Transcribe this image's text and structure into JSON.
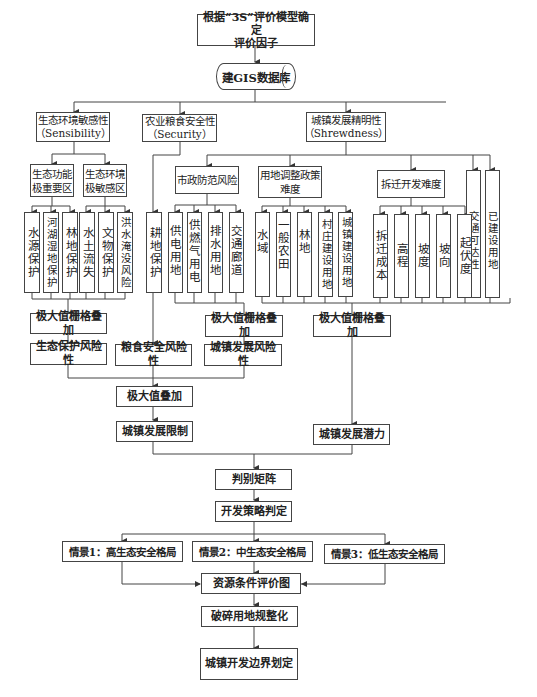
{
  "diagram": {
    "top": {
      "start": "根据“3S”评价模型确定\n评价因子",
      "database": "建GIS数据库"
    },
    "categories": {
      "sensibility": "生态环境敏感性\n（Sensibility）",
      "security": "农业粮食安全性\n（Security）",
      "shrewdness": "城镇发展精明性\n（Shrewdness）"
    },
    "subcategories": {
      "eco_important": "生态功能\n极重要区",
      "eco_sensitive": "生态环境\n极敏感区",
      "municipal_risk": "市政防范风险",
      "land_policy": "用地调整政策\n难度",
      "relocation": "拆迁开发难度",
      "traffic_access": "交通可达性",
      "built_land": "已建设用地"
    },
    "factors": {
      "eco_important": [
        "水源保护",
        "河湖湿地保护",
        "林地保护"
      ],
      "eco_sensitive": [
        "水土流失",
        "文物保护",
        "洪水淹没风险"
      ],
      "security": [
        "耕地保护"
      ],
      "municipal": [
        "供电用地",
        "供燃气用电",
        "排水用地",
        "交通廊道"
      ],
      "land_policy": [
        "水域",
        "一般农田",
        "林地",
        "村庄建设用地",
        "城镇建设用地"
      ],
      "relocation": [
        "拆迁成本",
        "高程",
        "坡度",
        "坡向",
        "起伏度"
      ]
    },
    "overlay": {
      "eco": "极大值栅格叠加",
      "municipal": "极大值栅格叠加",
      "potential": "极大值栅格叠加"
    },
    "risks": {
      "eco": "生态保护风险性",
      "food": "粮食安全风险性",
      "urban": "城镇发展风险性"
    },
    "max_overlay": "极大值叠加",
    "limit": "城镇发展限制",
    "potential": "城镇发展潜力",
    "matrix": "判别矩阵",
    "strategy": "开发策略判定",
    "scenarios": [
      "情景1：高生态安全格局",
      "情景2：中生态安全格局",
      "情景3：低生态安全格局"
    ],
    "resource_map": "资源条件评价图",
    "fragment": "破碎用地规整化",
    "boundary": "城镇开发边界划定"
  },
  "colors": {
    "line": "#444444",
    "box_border": "#444444",
    "background": "#ffffff",
    "text": "#222222"
  }
}
